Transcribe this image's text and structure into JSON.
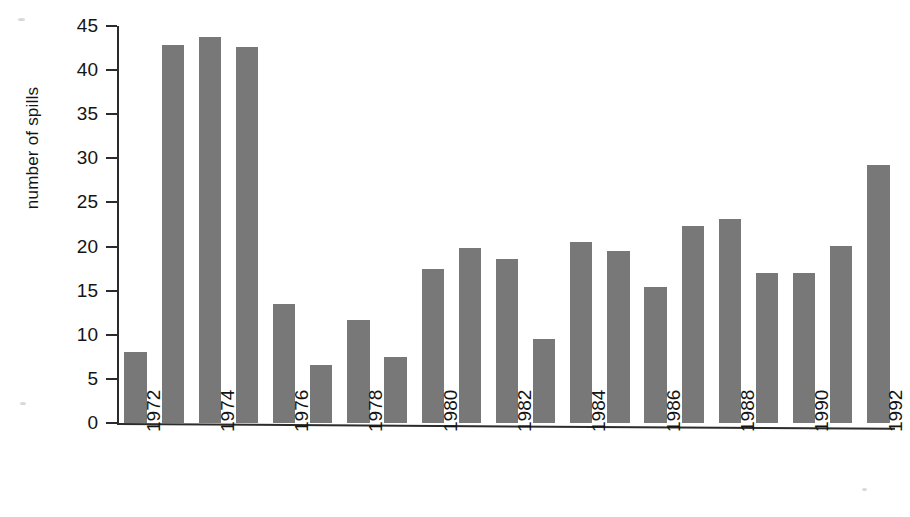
{
  "chart_data": {
    "type": "bar",
    "title": "",
    "xlabel": "",
    "ylabel": "number of spills",
    "ylim": [
      0,
      45
    ],
    "ytick_labels": [
      "0",
      "5",
      "10",
      "15",
      "20",
      "25",
      "30",
      "35",
      "40",
      "45"
    ],
    "ytick_values": [
      0,
      5,
      10,
      15,
      20,
      25,
      30,
      35,
      40,
      45
    ],
    "grid": false,
    "legend": null,
    "categories": [
      "1972",
      "1973",
      "1974",
      "1975",
      "1976",
      "1977",
      "1978",
      "1979",
      "1980",
      "1981",
      "1982",
      "1983",
      "1984",
      "1985",
      "1986",
      "1987",
      "1988",
      "1989",
      "1990",
      "1991",
      "1992"
    ],
    "xtick_labels": [
      "1972",
      "1974",
      "1976",
      "1978",
      "1980",
      "1982",
      "1984",
      "1986",
      "1988",
      "1990",
      "1992"
    ],
    "values": [
      8.0,
      42.8,
      43.7,
      42.6,
      13.5,
      6.6,
      11.7,
      7.5,
      17.5,
      19.8,
      18.6,
      9.5,
      20.5,
      19.5,
      15.4,
      22.3,
      23.1,
      17.0,
      17.0,
      20.1,
      29.2
    ],
    "bar_color": "#787878",
    "axis_color": "#2b2b2b",
    "background_color": "#ffffff"
  }
}
